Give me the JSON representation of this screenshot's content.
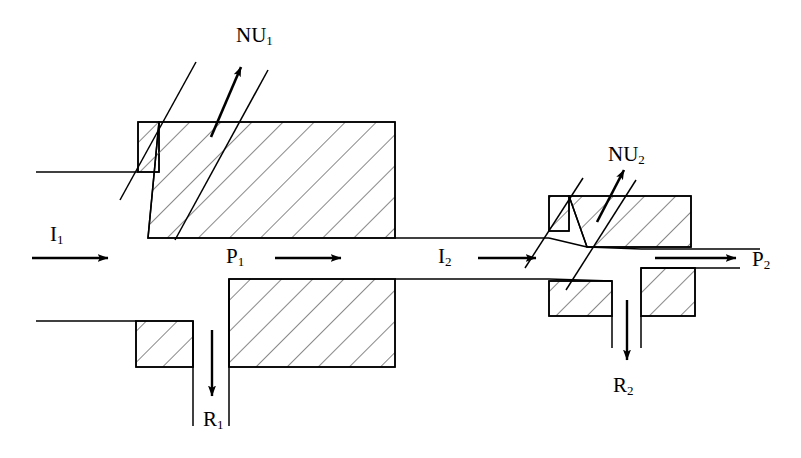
{
  "figure": {
    "kind": "piping-schematic",
    "background_color": "#ffffff",
    "line_color": "#000000",
    "hatch_color": "#555555"
  },
  "labels": [
    {
      "id": "nu1",
      "name": "NU1",
      "text": "NU",
      "sub": "1",
      "x": 236,
      "y": 25,
      "meaning": "first branch flow"
    },
    {
      "id": "i1",
      "name": "I1",
      "text": "I",
      "sub": "1",
      "x": 50,
      "y": 224,
      "meaning": "first inlet flow"
    },
    {
      "id": "p1",
      "name": "P1",
      "text": "P",
      "sub": "1",
      "x": 226,
      "y": 246,
      "meaning": "first through flow"
    },
    {
      "id": "r1",
      "name": "R1",
      "text": "R",
      "sub": "1",
      "x": 203,
      "y": 409,
      "meaning": "first return flow"
    },
    {
      "id": "i2",
      "name": "I2",
      "text": "I",
      "sub": "2",
      "x": 438,
      "y": 246,
      "meaning": "second inlet flow"
    },
    {
      "id": "nu2",
      "name": "NU2",
      "text": "NU",
      "sub": "2",
      "x": 608,
      "y": 144,
      "meaning": "second branch flow"
    },
    {
      "id": "p2",
      "name": "P2",
      "text": "P",
      "sub": "2",
      "x": 752,
      "y": 249,
      "meaning": "second through flow"
    },
    {
      "id": "r2",
      "name": "R2",
      "text": "R",
      "sub": "2",
      "x": 613,
      "y": 375,
      "meaning": "second return flow"
    }
  ],
  "flow_arrows": [
    {
      "id": "arrow-i1",
      "name": "inlet-1-arrow",
      "direction": "right",
      "x1": 32,
      "y1": 258,
      "x2": 112,
      "y2": 258
    },
    {
      "id": "arrow-p1",
      "name": "through-1-arrow",
      "direction": "right",
      "x1": 275,
      "y1": 258,
      "x2": 345,
      "y2": 258
    },
    {
      "id": "arrow-i2",
      "name": "inlet-2-arrow",
      "direction": "right",
      "x1": 478,
      "y1": 258,
      "x2": 540,
      "y2": 258
    },
    {
      "id": "arrow-p2",
      "name": "through-2-arrow",
      "direction": "right",
      "x1": 655,
      "y1": 258,
      "x2": 740,
      "y2": 258
    },
    {
      "id": "arrow-r1",
      "name": "return-1-arrow",
      "direction": "down",
      "x1": 212,
      "y1": 330,
      "x2": 212,
      "y2": 400
    },
    {
      "id": "arrow-r2",
      "name": "return-2-arrow",
      "direction": "down",
      "x1": 627,
      "y1": 300,
      "x2": 627,
      "y2": 364
    },
    {
      "id": "arrow-nu1",
      "name": "branch-1-arrow",
      "direction": "up-right",
      "x1": 212,
      "y1": 137,
      "x2": 244,
      "y2": 63
    },
    {
      "id": "arrow-nu2",
      "name": "branch-2-arrow",
      "direction": "up-right",
      "x1": 598,
      "y1": 222,
      "x2": 626,
      "y2": 166
    }
  ],
  "components": [
    {
      "id": "blk-ul-small",
      "name": "upper-left-flange-block"
    },
    {
      "id": "blk-ul-main",
      "name": "upper-left-body-block"
    },
    {
      "id": "blk-ll-small",
      "name": "lower-left-flange-block"
    },
    {
      "id": "blk-ll-main",
      "name": "lower-left-body-block"
    },
    {
      "id": "blk-ur-small",
      "name": "upper-right-flange-block"
    },
    {
      "id": "blk-ur-main",
      "name": "upper-right-body-block"
    },
    {
      "id": "blk-lr-small",
      "name": "lower-right-flange-block"
    },
    {
      "id": "blk-lr-main",
      "name": "lower-right-body-block"
    }
  ],
  "channels": [
    {
      "id": "ch-inlet-1",
      "name": "inlet-1-channel-wall"
    },
    {
      "id": "ch-branch-1",
      "name": "branch-1-channel"
    },
    {
      "id": "ch-return-1",
      "name": "return-1-channel"
    },
    {
      "id": "ch-mid",
      "name": "middle-channel"
    },
    {
      "id": "ch-branch-2",
      "name": "branch-2-channel"
    },
    {
      "id": "ch-return-2",
      "name": "return-2-channel"
    },
    {
      "id": "ch-outlet-2",
      "name": "outlet-2-channel"
    }
  ]
}
